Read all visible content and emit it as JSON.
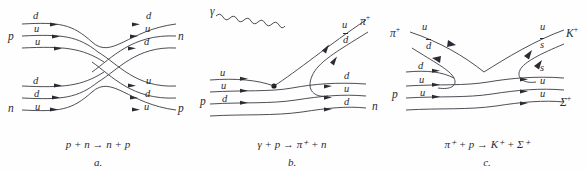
{
  "figure": {
    "background": "#fefefe",
    "stroke_color": "#3a3a42",
    "text_color": "#2a2a30",
    "panel_count": 3
  },
  "panels": [
    {
      "letter": "a.",
      "caption": "p + n → n + p",
      "reaction": {
        "incoming": [
          "p",
          "n"
        ],
        "outgoing": [
          "n",
          "p"
        ],
        "type": "quark-flow-exchange"
      },
      "particles": {
        "in_top": {
          "name": "p",
          "quarks": [
            "d",
            "u",
            "u"
          ]
        },
        "in_bottom": {
          "name": "n",
          "quarks": [
            "d",
            "d",
            "u"
          ]
        },
        "out_top": {
          "name": "n",
          "quarks": [
            "d",
            "u",
            "d"
          ]
        },
        "out_bottom": {
          "name": "p",
          "quarks": [
            "u",
            "d",
            "u"
          ]
        }
      }
    },
    {
      "letter": "b.",
      "caption": "γ + p → π⁺ + n",
      "reaction": {
        "incoming": [
          "γ",
          "p"
        ],
        "outgoing": [
          "π⁺",
          "n"
        ],
        "type": "photon-absorption"
      },
      "particles": {
        "photon": {
          "name": "γ",
          "quarks": []
        },
        "in_bottom": {
          "name": "p",
          "quarks": [
            "u",
            "u",
            "d"
          ]
        },
        "out_top": {
          "name": "π",
          "charge": "+",
          "quarks": [
            "u",
            "d"
          ],
          "antiquarks": [
            "d"
          ]
        },
        "out_bottom": {
          "name": "n",
          "quarks": [
            "d",
            "u",
            "d"
          ]
        }
      }
    },
    {
      "letter": "c.",
      "caption": "π⁺ + p → K⁺ + Σ⁺",
      "reaction": {
        "incoming": [
          "π⁺",
          "p"
        ],
        "outgoing": [
          "K⁺",
          "Σ⁺"
        ],
        "type": "strangeness-production"
      },
      "particles": {
        "in_top": {
          "name": "π",
          "charge": "+",
          "quarks": [
            "u",
            "d"
          ],
          "antiquarks": [
            "d"
          ]
        },
        "in_bottom": {
          "name": "p",
          "quarks": [
            "d",
            "u",
            "u"
          ]
        },
        "out_top": {
          "name": "K",
          "charge": "+",
          "quarks": [
            "u",
            "s"
          ],
          "antiquarks": [
            "s"
          ]
        },
        "out_bottom": {
          "name": "Σ",
          "charge": "+",
          "quarks": [
            "s",
            "u",
            "u"
          ]
        }
      }
    }
  ],
  "labels": {
    "a": {
      "p_left": "p",
      "n_right": "n",
      "n_left": "n",
      "p_right": "p",
      "tl_q1": "d",
      "tl_q2": "u",
      "tl_q3": "u",
      "tr_q1": "d",
      "tr_q2": "u",
      "tr_q3": "d",
      "bl_q1": "d",
      "bl_q2": "d",
      "bl_q3": "u",
      "br_q1": "u",
      "br_q2": "d",
      "br_q3": "u",
      "caption": "p + n → n + p",
      "letter": "a."
    },
    "b": {
      "gamma": "γ",
      "p_left": "p",
      "n_right": "n",
      "pi_right": "π",
      "pi_charge": "+",
      "tr_q1": "u",
      "tr_q2": "d",
      "bl_q1": "u",
      "bl_q2": "u",
      "bl_q3": "d",
      "br_q1": "d",
      "br_q2": "u",
      "br_q3": "d",
      "caption": "γ + p → π⁺ + n",
      "letter": "b."
    },
    "c": {
      "pi_left": "π",
      "pi_left_charge": "+",
      "p_left": "p",
      "k_right": "K",
      "k_charge": "+",
      "sigma_right": "Σ",
      "sigma_charge": "+",
      "tl_q1": "u",
      "tl_q2": "d",
      "tr_q1": "u",
      "tr_q2": "s",
      "bl_q1": "d",
      "bl_q2": "u",
      "bl_q3": "u",
      "br_q1": "s",
      "br_q2": "u",
      "br_q3": "u",
      "caption": "π⁺ + p → K⁺ + Σ⁺",
      "letter": "c."
    }
  }
}
